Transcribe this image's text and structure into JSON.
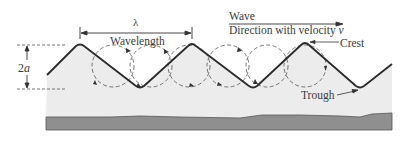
{
  "diagram": {
    "labels": {
      "lambda": "λ",
      "wavelength": "Wavelength",
      "wave": "Wave",
      "direction": "Direction with velocity v",
      "direction_prefix": "Direction with velocity ",
      "velocity_symbol": "v",
      "crest": "Crest",
      "trough": "Trough",
      "amplitude_2": "2",
      "amplitude_a": "a"
    },
    "colors": {
      "wave_line": "#2a2a2a",
      "water_fill": "#ececec",
      "ground_fill": "#8f8f8f",
      "ground_edge": "#555555",
      "dashed": "#555555",
      "text": "#3a3a3a"
    },
    "orbits_count": 6
  }
}
